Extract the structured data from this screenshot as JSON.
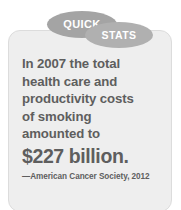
{
  "callout": {
    "badges": [
      {
        "id": "quick",
        "label": "QUICK"
      },
      {
        "id": "stats",
        "label": "STATS"
      }
    ],
    "body_lines": [
      "In 2007 the total",
      "health care and",
      "productivity costs",
      "of smoking",
      "amounted to"
    ],
    "headline": {
      "amount": "$227",
      "unit": " billion."
    },
    "attribution": "—American Cancer Society, 2012",
    "colors": {
      "card_background": "#eeeeee",
      "card_border": "#dcdcdc",
      "badge_quick": "#a4a4a4",
      "badge_stats": "#b0b0b0",
      "badge_text": "#ffffff",
      "body_text": "#5e5e5e",
      "page_background": "#ffffff"
    }
  }
}
